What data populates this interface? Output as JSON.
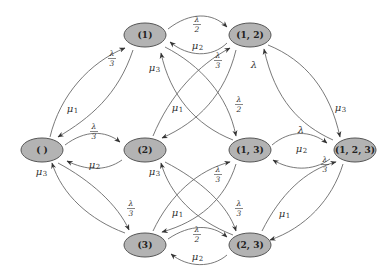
{
  "diagram": {
    "type": "state-transition-graph",
    "node_fill": "#b3b3b3",
    "node_stroke": "#555555",
    "edge_color": "#6a6a6a",
    "nodes": [
      {
        "id": "empty",
        "label": "( )",
        "x": 42,
        "y": 150
      },
      {
        "id": "s1",
        "label": "(1)",
        "x": 145,
        "y": 35
      },
      {
        "id": "s12",
        "label": "(1, 2)",
        "x": 250,
        "y": 35
      },
      {
        "id": "s2",
        "label": "(2)",
        "x": 145,
        "y": 150
      },
      {
        "id": "s13",
        "label": "(1, 3)",
        "x": 250,
        "y": 150
      },
      {
        "id": "s123",
        "label": "(1, 2, 3)",
        "x": 355,
        "y": 150
      },
      {
        "id": "s3",
        "label": "(3)",
        "x": 145,
        "y": 245
      },
      {
        "id": "s23",
        "label": "(2, 3)",
        "x": 250,
        "y": 245
      }
    ],
    "edges": [
      {
        "from": "empty",
        "to": "s1",
        "label": "λ/3"
      },
      {
        "from": "s1",
        "to": "empty",
        "label": "μ1"
      },
      {
        "from": "empty",
        "to": "s2",
        "label": "λ/3"
      },
      {
        "from": "s2",
        "to": "empty",
        "label": "μ2"
      },
      {
        "from": "empty",
        "to": "s3",
        "label": "λ/3"
      },
      {
        "from": "s3",
        "to": "empty",
        "label": "μ3"
      },
      {
        "from": "s1",
        "to": "s12",
        "label": "λ/2"
      },
      {
        "from": "s12",
        "to": "s1",
        "label": "μ2"
      },
      {
        "from": "s1",
        "to": "s13",
        "label": "λ/2"
      },
      {
        "from": "s13",
        "to": "s1",
        "label": "μ3"
      },
      {
        "from": "s2",
        "to": "s12",
        "label": "λ/3"
      },
      {
        "from": "s12",
        "to": "s2",
        "label": "μ1"
      },
      {
        "from": "s2",
        "to": "s23",
        "label": "λ/3"
      },
      {
        "from": "s23",
        "to": "s2",
        "label": "μ3"
      },
      {
        "from": "s3",
        "to": "s13",
        "label": "λ/3"
      },
      {
        "from": "s13",
        "to": "s3",
        "label": "μ1"
      },
      {
        "from": "s3",
        "to": "s23",
        "label": "λ/2"
      },
      {
        "from": "s23",
        "to": "s3",
        "label": "μ2"
      },
      {
        "from": "s12",
        "to": "s123",
        "label": "μ3"
      },
      {
        "from": "s123",
        "to": "s12",
        "label": "λ"
      },
      {
        "from": "s13",
        "to": "s123",
        "label": "λ"
      },
      {
        "from": "s123",
        "to": "s13",
        "label": "μ2"
      },
      {
        "from": "s23",
        "to": "s123",
        "label": "λ/3"
      },
      {
        "from": "s123",
        "to": "s23",
        "label": "μ1"
      }
    ],
    "symbols": {
      "lambda": "λ",
      "mu": "μ",
      "one": "1",
      "two": "2",
      "three": "3"
    }
  }
}
